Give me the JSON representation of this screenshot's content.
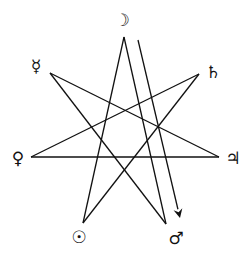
{
  "diagram": {
    "type": "heptagram",
    "stroke_color": "#111111",
    "background": "#ffffff",
    "planets": [
      {
        "name": "Moon",
        "glyph": "☽",
        "vertex": [
          124,
          37
        ],
        "label_pos": [
          122,
          20
        ]
      },
      {
        "name": "Saturn",
        "glyph": "♄",
        "vertex": [
          199,
          74
        ],
        "label_pos": [
          213,
          72
        ]
      },
      {
        "name": "Jupiter",
        "glyph": "♃",
        "vertex": [
          219,
          157
        ],
        "label_pos": [
          233,
          158
        ]
      },
      {
        "name": "Mars",
        "glyph": "♂",
        "vertex": [
          166,
          224
        ],
        "label_pos": [
          176,
          238
        ]
      },
      {
        "name": "Sun",
        "glyph": "☉",
        "vertex": [
          83,
          223
        ],
        "label_pos": [
          79,
          237
        ]
      },
      {
        "name": "Venus",
        "glyph": "♀",
        "vertex": [
          31,
          157
        ],
        "label_pos": [
          18,
          158
        ]
      },
      {
        "name": "Mercury",
        "glyph": "☿",
        "vertex": [
          50,
          73
        ],
        "label_pos": [
          36,
          66
        ]
      }
    ],
    "edges": [
      [
        "Moon",
        "Sun"
      ],
      [
        "Moon",
        "Mars"
      ],
      [
        "Mercury",
        "Jupiter"
      ],
      [
        "Mercury",
        "Mars"
      ],
      [
        "Saturn",
        "Venus"
      ],
      [
        "Saturn",
        "Sun"
      ],
      [
        "Venus",
        "Jupiter"
      ]
    ],
    "arrow": {
      "from": [
        138,
        40
      ],
      "to": [
        180,
        218
      ]
    }
  }
}
